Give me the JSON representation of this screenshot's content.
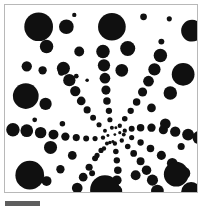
{
  "figure": {
    "panel": {
      "background_color": "#ffffff",
      "border_color": "#b8b8b8",
      "x": 4,
      "y": 4,
      "width": 194,
      "height": 189
    },
    "scalebar": {
      "label": "",
      "color": "#5e5e5e",
      "x": 5,
      "y": 201,
      "length_px": 35,
      "thickness_px": 5
    }
  },
  "chart_data": {
    "type": "scatter",
    "subtitle": "",
    "xlabel": "",
    "ylabel": "",
    "xlim": [
      0,
      194
    ],
    "ylim": [
      0,
      189
    ],
    "grid": false,
    "legend": "none",
    "marker": "circle",
    "marker_color": "#101010",
    "background_color": "#ffffff",
    "center": [
      111,
      131
    ],
    "arms": 8,
    "annotations": [],
    "points": [
      {
        "x": 111,
        "y": 131,
        "r": 1.4
      },
      {
        "x": 116,
        "y": 129,
        "r": 1.6
      },
      {
        "x": 104,
        "y": 132,
        "r": 1.5
      },
      {
        "x": 112,
        "y": 124,
        "r": 1.5
      },
      {
        "x": 109,
        "y": 138,
        "r": 1.6
      },
      {
        "x": 121,
        "y": 127,
        "r": 2.2
      },
      {
        "x": 128,
        "y": 125,
        "r": 3.0
      },
      {
        "x": 137,
        "y": 124,
        "r": 3.8
      },
      {
        "x": 148,
        "y": 124,
        "r": 4.2
      },
      {
        "x": 160,
        "y": 126,
        "r": 4.6
      },
      {
        "x": 172,
        "y": 128,
        "r": 5.2
      },
      {
        "x": 185,
        "y": 131,
        "r": 6.0
      },
      {
        "x": 196,
        "y": 134,
        "r": 6.6
      },
      {
        "x": 118,
        "y": 137,
        "r": 2.2
      },
      {
        "x": 124,
        "y": 143,
        "r": 2.8
      },
      {
        "x": 130,
        "y": 150,
        "r": 3.4
      },
      {
        "x": 137,
        "y": 158,
        "r": 4.0
      },
      {
        "x": 143,
        "y": 167,
        "r": 4.8
      },
      {
        "x": 149,
        "y": 177,
        "r": 5.6
      },
      {
        "x": 154,
        "y": 188,
        "r": 6.4
      },
      {
        "x": 111,
        "y": 140,
        "r": 2.2
      },
      {
        "x": 112,
        "y": 148,
        "r": 2.8
      },
      {
        "x": 113,
        "y": 157,
        "r": 3.2
      },
      {
        "x": 114,
        "y": 167,
        "r": 3.8
      },
      {
        "x": 113,
        "y": 177,
        "r": 4.8
      },
      {
        "x": 112,
        "y": 188,
        "r": 6.4
      },
      {
        "x": 103,
        "y": 140,
        "r": 2.0
      },
      {
        "x": 97,
        "y": 147,
        "r": 2.6
      },
      {
        "x": 91,
        "y": 155,
        "r": 3.0
      },
      {
        "x": 85,
        "y": 164,
        "r": 3.6
      },
      {
        "x": 79,
        "y": 174,
        "r": 4.4
      },
      {
        "x": 73,
        "y": 185,
        "r": 5.4
      },
      {
        "x": 99,
        "y": 134,
        "r": 2.2
      },
      {
        "x": 91,
        "y": 135,
        "r": 2.6
      },
      {
        "x": 82,
        "y": 135,
        "r": 3.0
      },
      {
        "x": 72,
        "y": 134,
        "r": 3.6
      },
      {
        "x": 61,
        "y": 133,
        "r": 4.2
      },
      {
        "x": 49,
        "y": 131,
        "r": 5.0
      },
      {
        "x": 36,
        "y": 129,
        "r": 5.8
      },
      {
        "x": 22,
        "y": 127,
        "r": 6.4
      },
      {
        "x": 8,
        "y": 126,
        "r": 6.8
      },
      {
        "x": 101,
        "y": 127,
        "r": 2.0
      },
      {
        "x": 95,
        "y": 121,
        "r": 2.6
      },
      {
        "x": 89,
        "y": 114,
        "r": 3.0
      },
      {
        "x": 83,
        "y": 106,
        "r": 3.6
      },
      {
        "x": 77,
        "y": 97,
        "r": 4.4
      },
      {
        "x": 71,
        "y": 87,
        "r": 5.2
      },
      {
        "x": 65,
        "y": 76,
        "r": 6.2
      },
      {
        "x": 59,
        "y": 64,
        "r": 6.6
      },
      {
        "x": 108,
        "y": 124,
        "r": 2.0
      },
      {
        "x": 106,
        "y": 116,
        "r": 2.6
      },
      {
        "x": 105,
        "y": 107,
        "r": 3.2
      },
      {
        "x": 103,
        "y": 97,
        "r": 3.8
      },
      {
        "x": 102,
        "y": 86,
        "r": 4.6
      },
      {
        "x": 101,
        "y": 74,
        "r": 5.4
      },
      {
        "x": 100,
        "y": 61,
        "r": 6.2
      },
      {
        "x": 99,
        "y": 47,
        "r": 6.8
      },
      {
        "x": 116,
        "y": 122,
        "r": 2.2
      },
      {
        "x": 121,
        "y": 115,
        "r": 2.8
      },
      {
        "x": 127,
        "y": 107,
        "r": 3.2
      },
      {
        "x": 133,
        "y": 98,
        "r": 3.8
      },
      {
        "x": 139,
        "y": 88,
        "r": 4.6
      },
      {
        "x": 145,
        "y": 77,
        "r": 5.4
      },
      {
        "x": 151,
        "y": 65,
        "r": 6.2
      },
      {
        "x": 157,
        "y": 51,
        "r": 6.8
      },
      {
        "x": 120,
        "y": 131,
        "r": 2.0
      },
      {
        "x": 128,
        "y": 134,
        "r": 2.6
      },
      {
        "x": 137,
        "y": 139,
        "r": 3.2
      },
      {
        "x": 147,
        "y": 145,
        "r": 3.8
      },
      {
        "x": 158,
        "y": 152,
        "r": 4.6
      },
      {
        "x": 169,
        "y": 160,
        "r": 5.4
      },
      {
        "x": 181,
        "y": 170,
        "r": 6.2
      },
      {
        "x": 106,
        "y": 139,
        "r": 1.8
      },
      {
        "x": 100,
        "y": 145,
        "r": 2.2
      },
      {
        "x": 93,
        "y": 152,
        "r": 2.6
      },
      {
        "x": 56,
        "y": 166,
        "r": 4.2
      },
      {
        "x": 42,
        "y": 178,
        "r": 5.0
      },
      {
        "x": 34,
        "y": 22,
        "r": 14.5
      },
      {
        "x": 108,
        "y": 22,
        "r": 14.0
      },
      {
        "x": 189,
        "y": 26,
        "r": 11.0
      },
      {
        "x": 21,
        "y": 92,
        "r": 13.0
      },
      {
        "x": 180,
        "y": 70,
        "r": 11.5
      },
      {
        "x": 25,
        "y": 172,
        "r": 14.5
      },
      {
        "x": 101,
        "y": 187,
        "r": 15.0
      },
      {
        "x": 173,
        "y": 171,
        "r": 12.5
      },
      {
        "x": 188,
        "y": 189,
        "r": 10.0
      },
      {
        "x": 42,
        "y": 42,
        "r": 6.8
      },
      {
        "x": 62,
        "y": 22,
        "r": 7.4
      },
      {
        "x": 75,
        "y": 47,
        "r": 5.0
      },
      {
        "x": 124,
        "y": 44,
        "r": 7.6
      },
      {
        "x": 118,
        "y": 66,
        "r": 6.4
      },
      {
        "x": 167,
        "y": 89,
        "r": 6.8
      },
      {
        "x": 41,
        "y": 100,
        "r": 6.2
      },
      {
        "x": 22,
        "y": 62,
        "r": 5.2
      },
      {
        "x": 38,
        "y": 66,
        "r": 4.2
      },
      {
        "x": 57,
        "y": 68,
        "r": 3.4
      },
      {
        "x": 72,
        "y": 72,
        "r": 2.4
      },
      {
        "x": 83,
        "y": 76,
        "r": 1.8
      },
      {
        "x": 46,
        "y": 144,
        "r": 6.6
      },
      {
        "x": 68,
        "y": 152,
        "r": 4.4
      },
      {
        "x": 132,
        "y": 172,
        "r": 5.0
      },
      {
        "x": 162,
        "y": 120,
        "r": 5.4
      },
      {
        "x": 148,
        "y": 104,
        "r": 4.4
      },
      {
        "x": 178,
        "y": 143,
        "r": 3.6
      },
      {
        "x": 58,
        "y": 120,
        "r": 2.8
      },
      {
        "x": 30,
        "y": 116,
        "r": 2.4
      },
      {
        "x": 88,
        "y": 170,
        "r": 3.0
      },
      {
        "x": 158,
        "y": 37,
        "r": 3.0
      },
      {
        "x": 70,
        "y": 10,
        "r": 2.2
      },
      {
        "x": 140,
        "y": 12,
        "r": 3.4
      },
      {
        "x": 166,
        "y": 14,
        "r": 2.6
      }
    ]
  }
}
